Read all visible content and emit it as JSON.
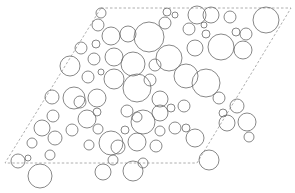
{
  "diagram": {
    "type": "circle-packing-in-parallelogram",
    "background": "#ffffff",
    "circle_stroke": "#6a6a6a",
    "boundary_stroke": "#9a9a9a",
    "boundary": {
      "style": "dashed",
      "points": [
        [
          101,
          8
        ],
        [
          291,
          8
        ],
        [
          197,
          163
        ],
        [
          5,
          163
        ]
      ]
    },
    "circles": [
      [
        101,
        13,
        5
      ],
      [
        98,
        25,
        6
      ],
      [
        111,
        36,
        9
      ],
      [
        128,
        34,
        8
      ],
      [
        149,
        37,
        15
      ],
      [
        81,
        48,
        6
      ],
      [
        96,
        44,
        4
      ],
      [
        70,
        66,
        10
      ],
      [
        94,
        59,
        6
      ],
      [
        114,
        57,
        9
      ],
      [
        133,
        64,
        12
      ],
      [
        101,
        72,
        3
      ],
      [
        88,
        77,
        6
      ],
      [
        114,
        79,
        10
      ],
      [
        137,
        88,
        14
      ],
      [
        52,
        97,
        7
      ],
      [
        74,
        98,
        11
      ],
      [
        97,
        98,
        9
      ],
      [
        160,
        99,
        8
      ],
      [
        167,
        12,
        4
      ],
      [
        175,
        15,
        3
      ],
      [
        197,
        15,
        9
      ],
      [
        211,
        15,
        8
      ],
      [
        230,
        17,
        6
      ],
      [
        165,
        23,
        6
      ],
      [
        189,
        29,
        6
      ],
      [
        204,
        25,
        3
      ],
      [
        206,
        34,
        4
      ],
      [
        195,
        48,
        8
      ],
      [
        169,
        58,
        13
      ],
      [
        221,
        47,
        13
      ],
      [
        236,
        32,
        4
      ],
      [
        246,
        34,
        6
      ],
      [
        243,
        50,
        9
      ],
      [
        266,
        20,
        13
      ],
      [
        155,
        65,
        6
      ],
      [
        186,
        76,
        12
      ],
      [
        206,
        83,
        14
      ],
      [
        219,
        98,
        6
      ],
      [
        237,
        106,
        7
      ],
      [
        247,
        122,
        9
      ],
      [
        223,
        113,
        4
      ],
      [
        227,
        123,
        8
      ],
      [
        249,
        137,
        5
      ],
      [
        195,
        138,
        9
      ],
      [
        209,
        160,
        10
      ],
      [
        184,
        106,
        6
      ],
      [
        175,
        128,
        6
      ],
      [
        186,
        128,
        4
      ],
      [
        171,
        108,
        4
      ],
      [
        160,
        131,
        5
      ],
      [
        143,
        163,
        5
      ],
      [
        53,
        116,
        6
      ],
      [
        42,
        128,
        8
      ],
      [
        55,
        138,
        7
      ],
      [
        32,
        143,
        5
      ],
      [
        50,
        155,
        5
      ],
      [
        18,
        161,
        7
      ],
      [
        28,
        158,
        3
      ],
      [
        40,
        176,
        12
      ],
      [
        72,
        130,
        6
      ],
      [
        80,
        102,
        6
      ],
      [
        87,
        119,
        9
      ],
      [
        97,
        112,
        4
      ],
      [
        98,
        129,
        5
      ],
      [
        89,
        145,
        5
      ],
      [
        111,
        143,
        12
      ],
      [
        103,
        172,
        8
      ],
      [
        113,
        160,
        5
      ],
      [
        118,
        147,
        7
      ],
      [
        137,
        142,
        9
      ],
      [
        143,
        122,
        12
      ],
      [
        160,
        113,
        8
      ],
      [
        125,
        130,
        4
      ],
      [
        127,
        111,
        6
      ],
      [
        150,
        80,
        6
      ],
      [
        156,
        146,
        6
      ],
      [
        133,
        171,
        10
      ],
      [
        137,
        117,
        5
      ],
      [
        5,
        162,
        0
      ]
    ]
  }
}
